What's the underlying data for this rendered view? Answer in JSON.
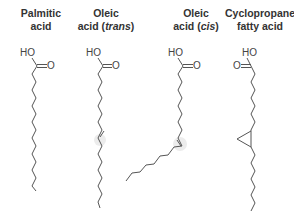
{
  "molecules": [
    {
      "id": "palmitic",
      "title_line1": "Palmitic",
      "title_line2": "acid",
      "title_italic": "",
      "title_suffix": "",
      "hydroxyl_label": "HO",
      "carbonyl_label": "O"
    },
    {
      "id": "oleic-trans",
      "title_line1": "Oleic",
      "title_line2": "acid (",
      "title_italic": "trans",
      "title_suffix": ")",
      "hydroxyl_label": "HO",
      "carbonyl_label": "O"
    },
    {
      "id": "oleic-cis",
      "title_line1": "Oleic",
      "title_line2": "acid (",
      "title_italic": "cis",
      "title_suffix": ")",
      "hydroxyl_label": "HO",
      "carbonyl_label": "O"
    },
    {
      "id": "cyclopropane",
      "title_line1": "Cyclopropane",
      "title_line2": "fatty acid",
      "title_italic": "",
      "title_suffix": "",
      "hydroxyl_label": "HO",
      "carbonyl_label": "O"
    }
  ],
  "colors": {
    "bond": "#555555",
    "text": "#333333",
    "highlight": "#e6e6e6"
  }
}
